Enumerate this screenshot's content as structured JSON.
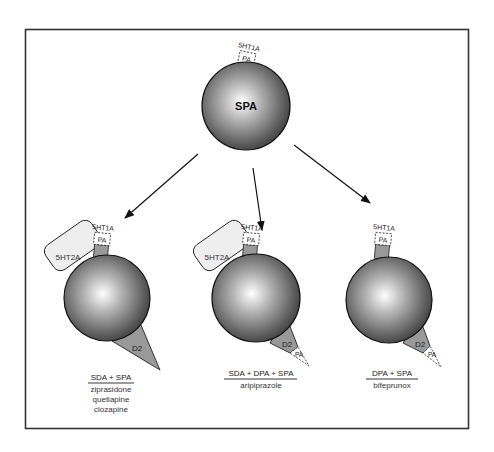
{
  "diagram": {
    "colors": {
      "frame": "#333333",
      "sphere_dark": "#3a3a3a",
      "sphere_light": "#ffffff",
      "tab_fill": "#999999",
      "ht2a_fill": "#eeeeee",
      "arrow": "#111111"
    },
    "top": {
      "sphere_label": "SPA",
      "receptor_label": "5HT1A",
      "pa_label": "PA"
    },
    "left": {
      "receptor_5ht1a": "5HT1A",
      "pa_label": "PA",
      "receptor_5ht2a": "5HT2A",
      "receptor_d2": "D2",
      "mechanism": "SDA + SPA",
      "drugs": [
        "ziprasidone",
        "quetiapine",
        "clozapine"
      ]
    },
    "middle": {
      "receptor_5ht1a": "5HT1A",
      "pa_label": "PA",
      "receptor_5ht2a": "5HT2A",
      "receptor_d2": "D2",
      "d2_pa_label": "PA",
      "mechanism": "SDA + DPA + SPA",
      "drugs": [
        "aripiprazole"
      ]
    },
    "right": {
      "receptor_5ht1a": "5HT1A",
      "pa_label": "PA",
      "receptor_d2": "D2",
      "d2_pa_label": "PA",
      "mechanism": "DPA + SPA",
      "drugs": [
        "bifeprunox"
      ]
    }
  }
}
